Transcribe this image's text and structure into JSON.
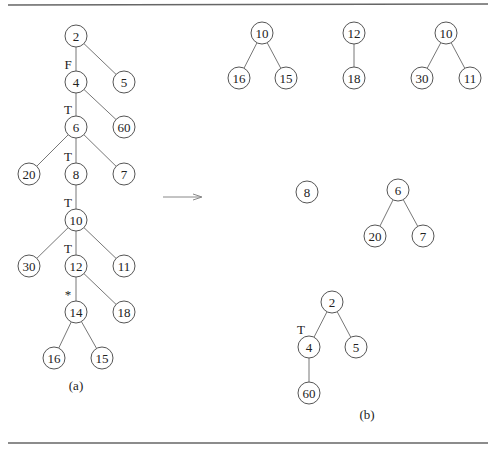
{
  "figure": {
    "caption_a": "(a)",
    "caption_b": "(b)",
    "arrow": "right-arrow"
  },
  "tree_a": {
    "nodes": [
      {
        "id": "a2",
        "label": "2",
        "x": 76,
        "y": 36
      },
      {
        "id": "a5",
        "label": "5",
        "x": 124,
        "y": 82
      },
      {
        "id": "a4",
        "label": "4",
        "x": 76,
        "y": 82,
        "mark": "F"
      },
      {
        "id": "a60",
        "label": "60",
        "x": 124,
        "y": 127
      },
      {
        "id": "a6",
        "label": "6",
        "x": 76,
        "y": 127,
        "mark": "T"
      },
      {
        "id": "a20",
        "label": "20",
        "x": 29,
        "y": 174
      },
      {
        "id": "a8",
        "label": "8",
        "x": 76,
        "y": 174,
        "mark": "T"
      },
      {
        "id": "a7",
        "label": "7",
        "x": 124,
        "y": 174
      },
      {
        "id": "a10",
        "label": "10",
        "x": 76,
        "y": 220,
        "mark": "T"
      },
      {
        "id": "a30",
        "label": "30",
        "x": 29,
        "y": 266
      },
      {
        "id": "a12",
        "label": "12",
        "x": 76,
        "y": 266,
        "mark": "T"
      },
      {
        "id": "a11",
        "label": "11",
        "x": 124,
        "y": 266
      },
      {
        "id": "a14",
        "label": "14",
        "x": 76,
        "y": 312,
        "mark": "*"
      },
      {
        "id": "a18",
        "label": "18",
        "x": 124,
        "y": 312
      },
      {
        "id": "a16",
        "label": "16",
        "x": 54,
        "y": 358
      },
      {
        "id": "a15",
        "label": "15",
        "x": 102,
        "y": 358
      }
    ],
    "edges": [
      [
        "a2",
        "a4"
      ],
      [
        "a2",
        "a5"
      ],
      [
        "a4",
        "a6"
      ],
      [
        "a4",
        "a60"
      ],
      [
        "a6",
        "a20"
      ],
      [
        "a6",
        "a8"
      ],
      [
        "a6",
        "a7"
      ],
      [
        "a8",
        "a10"
      ],
      [
        "a10",
        "a30"
      ],
      [
        "a10",
        "a12"
      ],
      [
        "a10",
        "a11"
      ],
      [
        "a12",
        "a14"
      ],
      [
        "a12",
        "a18"
      ],
      [
        "a14",
        "a16"
      ],
      [
        "a14",
        "a15"
      ]
    ],
    "caption_pos": {
      "x": 76,
      "y": 390
    }
  },
  "forest_b": {
    "nodes": [
      {
        "id": "b10a",
        "label": "10",
        "x": 262,
        "y": 33
      },
      {
        "id": "b16",
        "label": "16",
        "x": 239,
        "y": 78
      },
      {
        "id": "b15",
        "label": "15",
        "x": 286,
        "y": 78
      },
      {
        "id": "b12",
        "label": "12",
        "x": 354,
        "y": 33
      },
      {
        "id": "b18",
        "label": "18",
        "x": 354,
        "y": 78
      },
      {
        "id": "b10b",
        "label": "10",
        "x": 446,
        "y": 33
      },
      {
        "id": "b30",
        "label": "30",
        "x": 422,
        "y": 78
      },
      {
        "id": "b11",
        "label": "11",
        "x": 470,
        "y": 78
      },
      {
        "id": "b8",
        "label": "8",
        "x": 307,
        "y": 192
      },
      {
        "id": "b6",
        "label": "6",
        "x": 398,
        "y": 190
      },
      {
        "id": "b20",
        "label": "20",
        "x": 375,
        "y": 236
      },
      {
        "id": "b7",
        "label": "7",
        "x": 423,
        "y": 236
      },
      {
        "id": "b2",
        "label": "2",
        "x": 332,
        "y": 302
      },
      {
        "id": "b4",
        "label": "4",
        "x": 309,
        "y": 347,
        "mark": "T"
      },
      {
        "id": "b5",
        "label": "5",
        "x": 356,
        "y": 347
      },
      {
        "id": "b60",
        "label": "60",
        "x": 309,
        "y": 393
      }
    ],
    "edges": [
      [
        "b10a",
        "b16"
      ],
      [
        "b10a",
        "b15"
      ],
      [
        "b12",
        "b18"
      ],
      [
        "b10b",
        "b30"
      ],
      [
        "b10b",
        "b11"
      ],
      [
        "b6",
        "b20"
      ],
      [
        "b6",
        "b7"
      ],
      [
        "b2",
        "b4"
      ],
      [
        "b2",
        "b5"
      ],
      [
        "b4",
        "b60"
      ]
    ],
    "caption_pos": {
      "x": 367,
      "y": 419
    }
  }
}
